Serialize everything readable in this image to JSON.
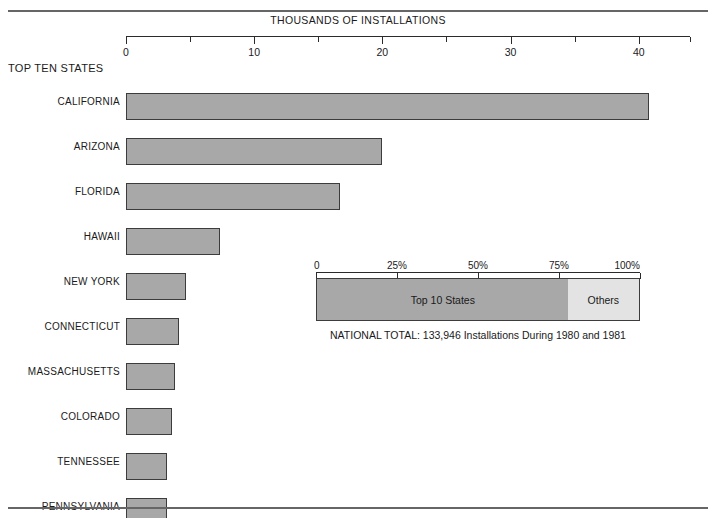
{
  "chart_data": {
    "type": "bar",
    "title": "THOUSANDS OF INSTALLATIONS",
    "orientation": "horizontal",
    "section_label": "TOP TEN STATES",
    "xlabel": "THOUSANDS OF INSTALLATIONS",
    "ylabel": "",
    "xlim": [
      0,
      44
    ],
    "grid": false,
    "legend": "none",
    "axis_ticks": [
      {
        "value": 0,
        "label": "0",
        "kind": "major"
      },
      {
        "value": 5,
        "label": "",
        "kind": "minor"
      },
      {
        "value": 10,
        "label": "10",
        "kind": "major"
      },
      {
        "value": 15,
        "label": "",
        "kind": "minor"
      },
      {
        "value": 20,
        "label": "20",
        "kind": "major"
      },
      {
        "value": 25,
        "label": "",
        "kind": "minor"
      },
      {
        "value": 30,
        "label": "30",
        "kind": "major"
      },
      {
        "value": 35,
        "label": "",
        "kind": "minor"
      },
      {
        "value": 40,
        "label": "40",
        "kind": "major"
      },
      {
        "value": 44,
        "label": "",
        "kind": "minor"
      }
    ],
    "categories": [
      "CALIFORNIA",
      "ARIZONA",
      "FLORIDA",
      "HAWAII",
      "NEW YORK",
      "CONNECTICUT",
      "MASSACHUSETTS",
      "COLORADO",
      "TENNESSEE",
      "PENNSYLVANIA"
    ],
    "values": [
      40.8,
      20.0,
      16.7,
      7.3,
      4.7,
      4.1,
      3.8,
      3.6,
      3.2,
      3.2
    ],
    "units": "thousands of installations",
    "bar_color": "#a8a8a8",
    "bar_border_color": "#3c3c3c"
  },
  "inset_chart": {
    "type": "bar",
    "subtype": "stacked-100",
    "axis_ticks": [
      {
        "value": 0,
        "label": "0"
      },
      {
        "value": 25,
        "label": "25%"
      },
      {
        "value": 50,
        "label": "50%"
      },
      {
        "value": 75,
        "label": "75%"
      },
      {
        "value": 100,
        "label": "100%"
      }
    ],
    "segments": [
      {
        "label": "Top 10 States",
        "value": 78,
        "color": "#a8a8a8"
      },
      {
        "label": "Others",
        "value": 22,
        "color": "#e3e3e3"
      }
    ],
    "caption": "NATIONAL TOTAL: 133,946 Installations During 1980 and 1981"
  }
}
